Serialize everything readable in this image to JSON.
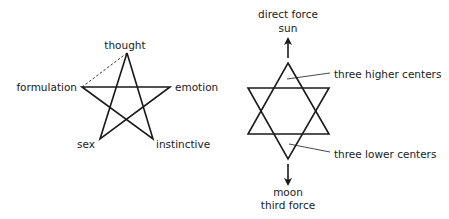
{
  "left_figure": {
    "name": "pentagram",
    "labels": {
      "thought": "thought",
      "formulation": "formulation",
      "emotion": "emotion",
      "sex": "sex",
      "instinctive": "instinctive"
    },
    "dashed_link": {
      "from": "formulation",
      "to": "thought"
    }
  },
  "right_figure": {
    "name": "hexagram",
    "top_labels": {
      "line1": "direct force",
      "line2": "sun"
    },
    "bottom_labels": {
      "line1": "moon",
      "line2": "third force"
    },
    "callouts": {
      "upper": "three higher centers",
      "lower": "three lower centers"
    },
    "arrows": {
      "top": "up",
      "bottom": "down"
    }
  },
  "colors": {
    "stroke": "#1a1a1a",
    "background": "#ffffff"
  }
}
